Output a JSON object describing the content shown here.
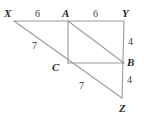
{
  "figure": {
    "stroke_color": "#9a9a9a",
    "label_color": "#2b2b2b",
    "background_color": "#ffffff",
    "vertices": [
      {
        "name": "X",
        "label": "X",
        "label_x": 4,
        "label_y": 8,
        "point_x": 14,
        "point_y": 21
      },
      {
        "name": "A",
        "label": "A",
        "label_x": 62,
        "label_y": 8,
        "point_x": 68,
        "point_y": 21
      },
      {
        "name": "Y",
        "label": "Y",
        "label_x": 122,
        "label_y": 8,
        "point_x": 124,
        "point_y": 21
      },
      {
        "name": "C",
        "label": "C",
        "label_x": 52,
        "label_y": 62,
        "point_x": 68,
        "point_y": 63
      },
      {
        "name": "B",
        "label": "B",
        "label_x": 127,
        "label_y": 57,
        "point_x": 124,
        "point_y": 63
      },
      {
        "name": "Z",
        "label": "Z",
        "label_x": 119,
        "label_y": 103,
        "point_x": 122,
        "point_y": 98
      }
    ],
    "segments": [
      {
        "name": "segment-XY",
        "from": "X",
        "to": "Y"
      },
      {
        "name": "segment-XZ",
        "from": "X",
        "to": "Z"
      },
      {
        "name": "segment-YZ",
        "from": "Y",
        "to": "Z"
      },
      {
        "name": "segment-AC",
        "from": "A",
        "to": "C"
      },
      {
        "name": "segment-CB",
        "from": "C",
        "to": "B"
      },
      {
        "name": "segment-AB",
        "from": "A",
        "to": "B"
      }
    ],
    "measures": [
      {
        "name": "measure-XA",
        "value": "6",
        "x": 35,
        "y": 9,
        "for_segment": "X to A"
      },
      {
        "name": "measure-AY",
        "value": "6",
        "x": 93,
        "y": 9,
        "for_segment": "A to Y"
      },
      {
        "name": "measure-XC",
        "value": "7",
        "x": 32,
        "y": 41,
        "for_segment": "X to C"
      },
      {
        "name": "measure-CZ",
        "value": "7",
        "x": 79,
        "y": 81,
        "for_segment": "C to Z"
      },
      {
        "name": "measure-YB",
        "value": "4",
        "x": 128,
        "y": 37,
        "for_segment": "Y to B"
      },
      {
        "name": "measure-BZ",
        "value": "4",
        "x": 127,
        "y": 75,
        "for_segment": "B to Z"
      }
    ]
  }
}
